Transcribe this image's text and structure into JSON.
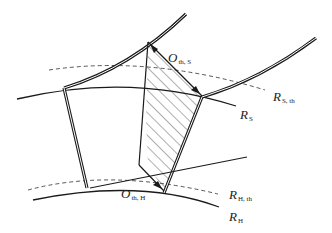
{
  "diagram": {
    "labels": {
      "o_th_s": {
        "main": "O",
        "sub": "th, S"
      },
      "o_th_h": {
        "main": "O",
        "sub": "th, H"
      },
      "r_s_th": {
        "main": "R",
        "sub": "S, th"
      },
      "r_s": {
        "main": "R",
        "sub": "S"
      },
      "r_h_th": {
        "main": "R",
        "sub": "H, th"
      },
      "r_h": {
        "main": "R",
        "sub": "H"
      }
    },
    "colors": {
      "line": "#1a1a1a",
      "dashed": "#444444",
      "hatch": "#333333"
    }
  }
}
